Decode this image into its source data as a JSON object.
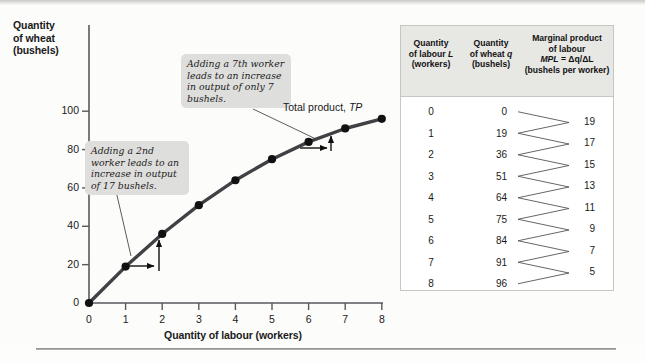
{
  "chart_data": {
    "type": "line",
    "title": "",
    "xlabel": "Quantity of labour (workers)",
    "ylabel": "Quantity of wheat (bushels)",
    "x": [
      0,
      1,
      2,
      3,
      4,
      5,
      6,
      7,
      8
    ],
    "values": [
      0,
      19,
      36,
      51,
      64,
      75,
      84,
      91,
      96
    ],
    "series": [
      {
        "name": "Total product, TP",
        "values": [
          0,
          19,
          36,
          51,
          64,
          75,
          84,
          91,
          96
        ]
      }
    ],
    "xlim": [
      0,
      8
    ],
    "ylim": [
      0,
      110
    ],
    "xticks": [
      "0",
      "1",
      "2",
      "3",
      "4",
      "5",
      "6",
      "7",
      "8"
    ],
    "yticks": [
      "0",
      "20",
      "40",
      "60",
      "80",
      "100"
    ],
    "grid": false,
    "legend": "none",
    "curve_color": "#404045",
    "marker_color": "#111111",
    "annotations": [
      "Adding a 2nd worker leads to an increase in output of 17 bushels.",
      "Adding a 7th worker leads to an increase in output of only 7 bushels.",
      "Total product, TP"
    ]
  },
  "chart": {
    "y_axis_title": "Quantity\nof wheat\n(bushels)",
    "y_axis_title_lines": [
      "Quantity",
      "of wheat",
      "(bushels)"
    ],
    "x_axis_title": "Quantity of labour (workers)",
    "y_ticks": [
      "100",
      "80",
      "60",
      "40",
      "20",
      "0"
    ],
    "x_ticks": [
      "0",
      "1",
      "2",
      "3",
      "4",
      "5",
      "6",
      "7",
      "8"
    ],
    "curve_label_text": "Total product, ",
    "curve_label_italic": "TP",
    "callout_2nd": "Adding a 2nd worker leads to an increase in output of 17 bushels.",
    "callout_7th": "Adding a 7th worker leads to an increase in output of only 7 bushels."
  },
  "table": {
    "headers": {
      "labour": {
        "line1": "Quantity",
        "line2_pre": "of labour ",
        "line2_italic": "L",
        "line3": "(workers)"
      },
      "wheat": {
        "line1": "Quantity",
        "line2_pre": "of wheat ",
        "line2_italic": "q",
        "line3": "(bushels)"
      },
      "mpl": {
        "line1": "Marginal product",
        "line2": "of labour",
        "line3_italic": "MPL",
        "line3_rest": " = Δq/ΔL",
        "line4": "(bushels per worker)"
      }
    },
    "rows": [
      {
        "labour": "0",
        "wheat": "0"
      },
      {
        "labour": "1",
        "wheat": "19"
      },
      {
        "labour": "2",
        "wheat": "36"
      },
      {
        "labour": "3",
        "wheat": "51"
      },
      {
        "labour": "4",
        "wheat": "64"
      },
      {
        "labour": "5",
        "wheat": "75"
      },
      {
        "labour": "6",
        "wheat": "84"
      },
      {
        "labour": "7",
        "wheat": "91"
      },
      {
        "labour": "8",
        "wheat": "96"
      }
    ],
    "mpl_values": [
      "19",
      "17",
      "15",
      "13",
      "11",
      "9",
      "7",
      "5"
    ]
  }
}
